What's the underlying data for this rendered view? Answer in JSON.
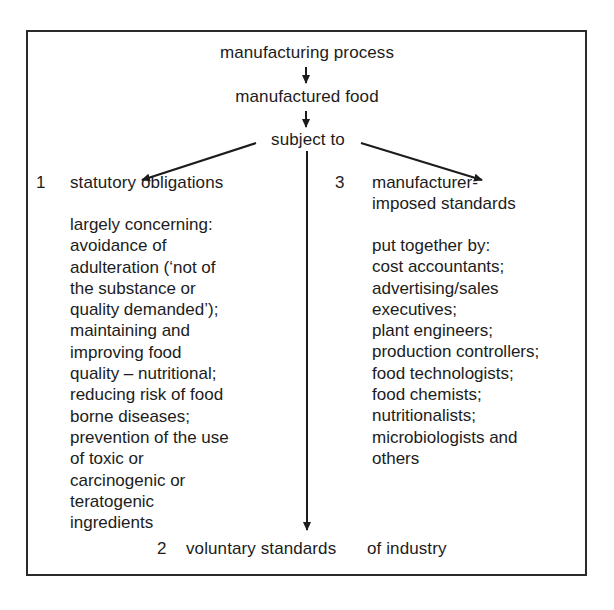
{
  "diagram": {
    "nodes": {
      "process": "manufacturing process",
      "food": "manufactured food",
      "subject": "subject to"
    },
    "branches": [
      {
        "number": "1",
        "title": "statutory obligations",
        "description_lines": [
          "largely concerning:",
          "avoidance of",
          "adulteration (‘not of",
          "the substance or",
          "quality demanded’);",
          "maintaining and",
          "improving food",
          "quality – nutritional;",
          "reducing risk of food",
          "borne diseases;",
          "prevention of the use",
          "of toxic or",
          "carcinogenic or",
          "teratogenic",
          "ingredients"
        ]
      },
      {
        "number": "2",
        "title": "voluntary standards",
        "suffix": "of industry"
      },
      {
        "number": "3",
        "title_lines": [
          "manufacturer-",
          "imposed standards"
        ],
        "description_lines": [
          "put together by:",
          "cost accountants;",
          "advertising/sales",
          "executives;",
          "plant engineers;",
          "production controllers;",
          "food technologists;",
          "food chemists;",
          "nutritionalists;",
          "microbiologists and",
          "others"
        ]
      }
    ],
    "edges": [
      {
        "from": "manufacturing process",
        "to": "manufactured food"
      },
      {
        "from": "manufactured food",
        "to": "subject to"
      },
      {
        "from": "subject to",
        "to": "1 statutory obligations"
      },
      {
        "from": "subject to",
        "to": "2 voluntary standards of industry"
      },
      {
        "from": "subject to",
        "to": "3 manufacturer-imposed standards"
      }
    ]
  }
}
